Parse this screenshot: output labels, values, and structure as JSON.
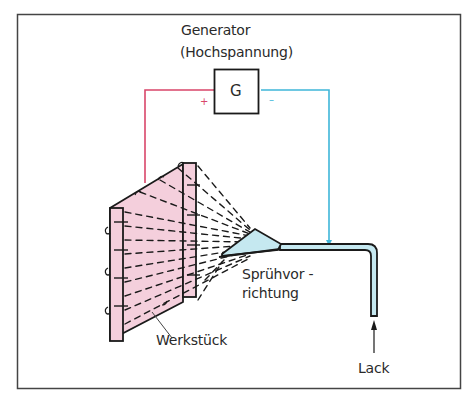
{
  "labels": {
    "generator_line1": "Generator",
    "generator_line2": "(Hochspannung)",
    "generator_symbol": "G",
    "plus": "+",
    "minus": "–",
    "spray_line1": "Sprühvor -",
    "spray_line2": "richtung",
    "workpiece": "Werkstück",
    "paint": "Lack"
  },
  "colors": {
    "positive_wire": "#d9466a",
    "negative_wire": "#3fb6d9",
    "workpiece_fill": "#f4cfdc",
    "nozzle_fill": "#c5e8f0",
    "outline": "#1a1a1a"
  }
}
